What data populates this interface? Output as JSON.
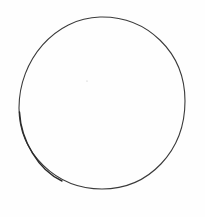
{
  "image": {
    "description": "Hand-drawn circle outline on white paper",
    "background_color": "#fefefe",
    "shapes": [
      {
        "type": "circle",
        "cx": 102,
        "cy": 103,
        "r": 84,
        "stroke_color": "#3a3a3a",
        "stroke_width": 1.2,
        "fill": "none"
      }
    ]
  }
}
